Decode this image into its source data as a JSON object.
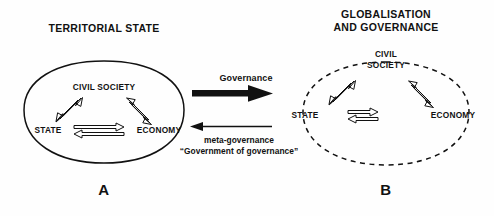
{
  "figure": {
    "background_color": "#fefefe",
    "ink_color": "#111111"
  },
  "panels": [
    {
      "id": "A",
      "title": "TERRITORIAL STATE",
      "letter": "A",
      "boundary_style": "solid",
      "nodes": {
        "top": "CIVIL SOCIETY",
        "left": "STATE",
        "right": "ECONOMY"
      }
    },
    {
      "id": "B",
      "title_line1": "GLOBALISATION",
      "title_line2": "AND GOVERNANCE",
      "letter": "B",
      "boundary_style": "dashed",
      "nodes": {
        "top_line1": "CIVIL",
        "top_line2": "SOCIETY",
        "left": "STATE",
        "right": "ECONOMY"
      }
    }
  ],
  "flows": {
    "forward_label": "Governance",
    "forward_direction": "right",
    "forward_weight": "thick",
    "reverse_label_line1": "meta-governance",
    "reverse_label_line2": "“Government of governance”",
    "reverse_direction": "left",
    "reverse_weight": "thin"
  }
}
